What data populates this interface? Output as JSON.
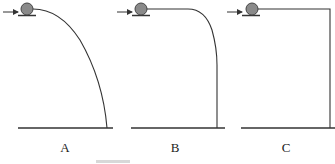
{
  "figure": {
    "panels": [
      {
        "label": "A",
        "curve": "parabolic"
      },
      {
        "label": "B",
        "curve": "rounded-corner"
      },
      {
        "label": "C",
        "curve": "right-angle"
      }
    ],
    "colors": {
      "line": "#333333",
      "ball": "#8a8a8a",
      "ball_stroke": "#444444"
    }
  }
}
